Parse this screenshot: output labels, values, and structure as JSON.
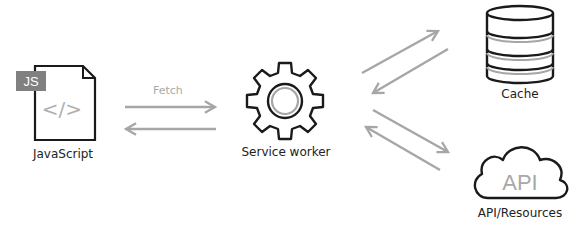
{
  "diagram": {
    "nodes": {
      "javascript": {
        "label": "JavaScript",
        "badge": "JS",
        "glyph": "</>",
        "icon": "code-file-icon"
      },
      "service_worker": {
        "label": "Service worker",
        "icon": "gear-icon"
      },
      "cache": {
        "label": "Cache",
        "icon": "database-icon"
      },
      "api": {
        "label": "API/Resources",
        "cloud_text": "API",
        "icon": "cloud-icon"
      }
    },
    "edges": [
      {
        "from": "javascript",
        "to": "service_worker",
        "label": "Fetch"
      },
      {
        "from": "service_worker",
        "to": "javascript",
        "label": ""
      },
      {
        "from": "service_worker",
        "to": "cache",
        "label": ""
      },
      {
        "from": "cache",
        "to": "service_worker",
        "label": ""
      },
      {
        "from": "service_worker",
        "to": "api",
        "label": ""
      },
      {
        "from": "api",
        "to": "service_worker",
        "label": ""
      }
    ],
    "colors": {
      "stroke": "#1a1a1a",
      "arrow": "#a6a6a6",
      "badge_bg": "#808080",
      "muted_text": "#a8a8a8"
    }
  }
}
